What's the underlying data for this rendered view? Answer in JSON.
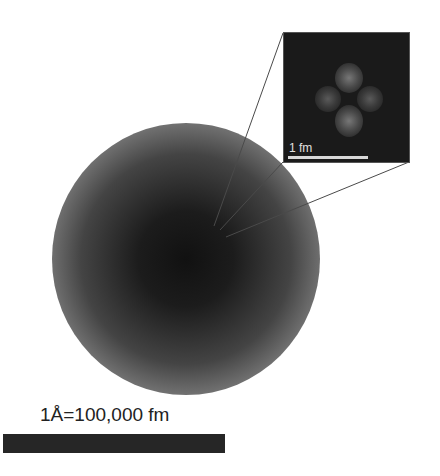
{
  "figure": {
    "atom": {
      "shape": "circle",
      "color_center": "#111111",
      "color_edge": "#d6d6d6"
    },
    "inset": {
      "label": "1 fm",
      "background": "#1a1a1a",
      "particles": 4,
      "particle_color": "#6a6a6a"
    },
    "main_scale": {
      "label": "1Å=100,000 fm",
      "bar_color": "#262626"
    }
  }
}
